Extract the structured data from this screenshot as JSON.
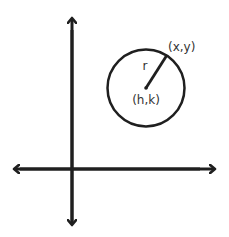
{
  "diagram": {
    "labels": {
      "point": "(x,y)",
      "center": "(h,k)",
      "radius": "r"
    },
    "colors": {
      "stroke": "#1f1f1f",
      "text": "#333333",
      "background": "#ffffff"
    }
  }
}
